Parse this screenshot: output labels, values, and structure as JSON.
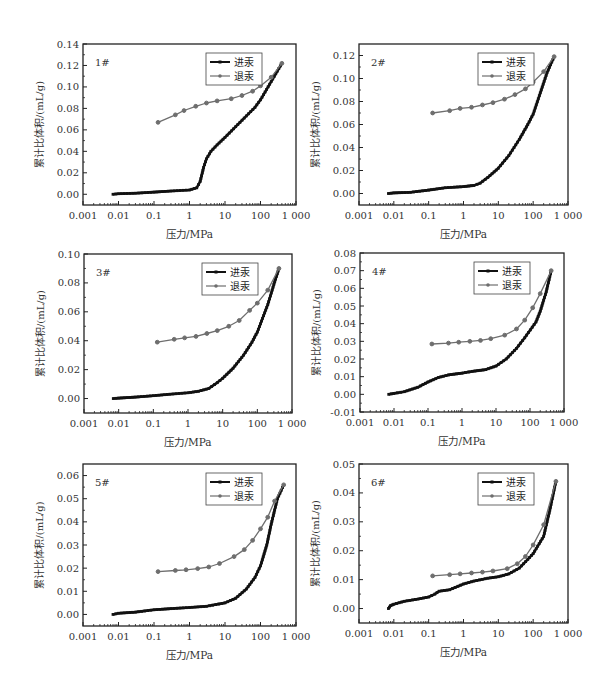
{
  "figure": {
    "layout": "3 rows x 2 columns of mercury intrusion/extrusion curves",
    "x_label": "压力/MPa",
    "y_label": "累计比体积/(mL/g)",
    "legend": [
      "进汞",
      "退汞"
    ],
    "colors": {
      "intrusion": "#111111",
      "extrusion": "#6e6e6e",
      "frame": "#222222"
    }
  },
  "chart_data": [
    {
      "type": "line",
      "panel_label": "1#",
      "title": "",
      "xlabel": "压力/MPa",
      "ylabel": "累计比体积/(mL/g)",
      "xscale": "log",
      "xlim": [
        0.001,
        1000
      ],
      "ylim": [
        -0.01,
        0.14
      ],
      "xticks": [
        "0.001",
        "0.01",
        "0.1",
        "1",
        "10",
        "100",
        "1 000"
      ],
      "yticks": [
        "0.00",
        "0.02",
        "0.04",
        "0.06",
        "0.08",
        "0.10",
        "0.12",
        "0.14"
      ],
      "ytick_values": [
        0,
        0.02,
        0.04,
        0.06,
        0.08,
        0.1,
        0.12,
        0.14
      ],
      "legend_position": "upper right",
      "grid": false,
      "series": [
        {
          "name": "进汞",
          "x": [
            0.007,
            0.01,
            0.03,
            0.1,
            0.3,
            1,
            1.6,
            2,
            2.5,
            3,
            4,
            6,
            10,
            20,
            40,
            70,
            100,
            200,
            400
          ],
          "values": [
            0.0,
            0.0005,
            0.001,
            0.002,
            0.003,
            0.004,
            0.006,
            0.012,
            0.025,
            0.033,
            0.04,
            0.046,
            0.053,
            0.063,
            0.073,
            0.081,
            0.088,
            0.105,
            0.122
          ]
        },
        {
          "name": "退汞",
          "x": [
            0.13,
            0.4,
            0.7,
            1.5,
            3,
            6,
            15,
            30,
            60,
            100,
            200,
            400
          ],
          "values": [
            0.067,
            0.074,
            0.078,
            0.082,
            0.085,
            0.087,
            0.089,
            0.092,
            0.096,
            0.101,
            0.109,
            0.122
          ]
        }
      ]
    },
    {
      "type": "line",
      "panel_label": "2#",
      "title": "",
      "xlabel": "压力/MPa",
      "ylabel": "累计比体积/(mL/g)",
      "xscale": "log",
      "xlim": [
        0.001,
        1000
      ],
      "ylim": [
        -0.01,
        0.13
      ],
      "xticks": [
        "0.001",
        "0.01",
        "0.1",
        "1",
        "10",
        "100",
        "1 000"
      ],
      "yticks": [
        "0.00",
        "0.02",
        "0.04",
        "0.06",
        "0.08",
        "0.10",
        "0.12"
      ],
      "ytick_values": [
        0,
        0.02,
        0.04,
        0.06,
        0.08,
        0.1,
        0.12
      ],
      "legend_position": "upper right",
      "grid": false,
      "series": [
        {
          "name": "进汞",
          "x": [
            0.007,
            0.01,
            0.03,
            0.1,
            0.3,
            1,
            2,
            3,
            5,
            10,
            20,
            40,
            70,
            100,
            150,
            250,
            400
          ],
          "values": [
            0.0,
            0.0005,
            0.001,
            0.003,
            0.005,
            0.006,
            0.007,
            0.009,
            0.014,
            0.022,
            0.033,
            0.047,
            0.06,
            0.069,
            0.085,
            0.105,
            0.119
          ]
        },
        {
          "name": "退汞",
          "x": [
            0.13,
            0.4,
            0.8,
            1.7,
            3.5,
            7,
            15,
            30,
            60,
            100,
            200,
            400
          ],
          "values": [
            0.07,
            0.072,
            0.074,
            0.075,
            0.077,
            0.079,
            0.082,
            0.086,
            0.091,
            0.097,
            0.106,
            0.119
          ]
        }
      ]
    },
    {
      "type": "line",
      "panel_label": "3#",
      "title": "",
      "xlabel": "压力/MPa",
      "ylabel": "累计比体积/(mL/g)",
      "xscale": "log",
      "xlim": [
        0.001,
        1000
      ],
      "ylim": [
        -0.01,
        0.1
      ],
      "xticks": [
        "0.001",
        "0.01",
        "0.1",
        "1",
        "10",
        "100",
        "1 000"
      ],
      "yticks": [
        "0.00",
        "0.02",
        "0.04",
        "0.06",
        "0.08",
        "0.10"
      ],
      "ytick_values": [
        0,
        0.02,
        0.04,
        0.06,
        0.08,
        0.1
      ],
      "legend_position": "upper right",
      "grid": false,
      "series": [
        {
          "name": "进汞",
          "x": [
            0.007,
            0.01,
            0.03,
            0.1,
            0.3,
            1,
            2,
            4,
            7,
            10,
            20,
            40,
            70,
            100,
            200,
            300,
            420
          ],
          "values": [
            0.0,
            0.0003,
            0.001,
            0.002,
            0.003,
            0.004,
            0.005,
            0.007,
            0.011,
            0.014,
            0.021,
            0.03,
            0.039,
            0.046,
            0.065,
            0.079,
            0.09
          ]
        },
        {
          "name": "退汞",
          "x": [
            0.13,
            0.4,
            0.8,
            1.7,
            3.5,
            7,
            15,
            30,
            60,
            100,
            200,
            420
          ],
          "values": [
            0.039,
            0.041,
            0.042,
            0.043,
            0.045,
            0.047,
            0.05,
            0.054,
            0.061,
            0.066,
            0.075,
            0.09
          ]
        }
      ]
    },
    {
      "type": "line",
      "panel_label": "4#",
      "title": "",
      "xlabel": "压力/MPa",
      "ylabel": "累计比体积/(mL/g)",
      "xscale": "log",
      "xlim": [
        0.001,
        1000
      ],
      "ylim": [
        -0.01,
        0.08
      ],
      "xticks": [
        "0.001",
        "0.01",
        "0.1",
        "1",
        "10",
        "100",
        "1 000"
      ],
      "yticks": [
        "-0.01",
        "0.00",
        "0.01",
        "0.02",
        "0.03",
        "0.04",
        "0.05",
        "0.06",
        "0.07",
        "0.08"
      ],
      "ytick_values": [
        -0.01,
        0,
        0.01,
        0.02,
        0.03,
        0.04,
        0.05,
        0.06,
        0.07,
        0.08
      ],
      "legend_position": "upper right",
      "grid": false,
      "series": [
        {
          "name": "进汞",
          "x": [
            0.007,
            0.01,
            0.02,
            0.05,
            0.1,
            0.2,
            0.4,
            1,
            2,
            5,
            10,
            20,
            40,
            70,
            150,
            200,
            300,
            420
          ],
          "values": [
            0.0,
            0.0005,
            0.0015,
            0.004,
            0.007,
            0.0095,
            0.011,
            0.012,
            0.013,
            0.014,
            0.016,
            0.02,
            0.026,
            0.032,
            0.041,
            0.047,
            0.058,
            0.07
          ]
        },
        {
          "name": "退汞",
          "x": [
            0.13,
            0.4,
            0.8,
            1.7,
            3.5,
            7,
            18,
            40,
            70,
            120,
            200,
            420
          ],
          "values": [
            0.0285,
            0.029,
            0.0295,
            0.03,
            0.0305,
            0.0315,
            0.0335,
            0.037,
            0.042,
            0.049,
            0.057,
            0.07
          ]
        }
      ]
    },
    {
      "type": "line",
      "panel_label": "5#",
      "title": "",
      "xlabel": "压力/MPa",
      "ylabel": "累计比体积/(mL/g)",
      "xscale": "log",
      "xlim": [
        0.001,
        1000
      ],
      "ylim": [
        -0.005,
        0.065
      ],
      "xticks": [
        "0.001",
        "0.01",
        "0.1",
        "1",
        "10",
        "100",
        "1 000"
      ],
      "yticks": [
        "0.00",
        "0.01",
        "0.02",
        "0.03",
        "0.04",
        "0.05",
        "0.06"
      ],
      "ytick_values": [
        0,
        0.01,
        0.02,
        0.03,
        0.04,
        0.05,
        0.06
      ],
      "legend_position": "upper right",
      "grid": false,
      "series": [
        {
          "name": "进汞",
          "x": [
            0.007,
            0.01,
            0.03,
            0.1,
            0.3,
            1,
            3,
            10,
            20,
            40,
            70,
            100,
            150,
            200,
            300,
            450
          ],
          "values": [
            0.0,
            0.0005,
            0.001,
            0.002,
            0.0025,
            0.003,
            0.0035,
            0.005,
            0.007,
            0.011,
            0.016,
            0.021,
            0.03,
            0.039,
            0.05,
            0.056
          ]
        },
        {
          "name": "退汞",
          "x": [
            0.13,
            0.4,
            0.8,
            1.7,
            3.5,
            7,
            18,
            35,
            60,
            100,
            160,
            250,
            450
          ],
          "values": [
            0.0185,
            0.019,
            0.0193,
            0.0198,
            0.0205,
            0.022,
            0.025,
            0.028,
            0.032,
            0.037,
            0.042,
            0.049,
            0.056
          ]
        }
      ]
    },
    {
      "type": "line",
      "panel_label": "6#",
      "title": "",
      "xlabel": "压力/MPa",
      "ylabel": "累计比体积/(mL/g)",
      "xscale": "log",
      "xlim": [
        0.001,
        1000
      ],
      "ylim": [
        -0.005,
        0.05
      ],
      "xticks": [
        "0.001",
        "0.01",
        "0.1",
        "1",
        "10",
        "100",
        "1 000"
      ],
      "yticks": [
        "0.00",
        "0.01",
        "0.02",
        "0.03",
        "0.04",
        "0.05"
      ],
      "ytick_values": [
        0,
        0.01,
        0.02,
        0.03,
        0.04,
        0.05
      ],
      "legend_position": "upper right",
      "grid": false,
      "series": [
        {
          "name": "进汞",
          "x": [
            0.007,
            0.008,
            0.01,
            0.02,
            0.05,
            0.1,
            0.15,
            0.2,
            0.4,
            1,
            2,
            5,
            10,
            20,
            40,
            70,
            100,
            200,
            300,
            450
          ],
          "values": [
            0.0,
            0.001,
            0.0015,
            0.0025,
            0.0033,
            0.004,
            0.005,
            0.006,
            0.0065,
            0.0085,
            0.0095,
            0.0105,
            0.011,
            0.012,
            0.014,
            0.017,
            0.019,
            0.025,
            0.034,
            0.044
          ]
        },
        {
          "name": "退汞",
          "x": [
            0.13,
            0.4,
            0.8,
            1.7,
            3.5,
            7,
            18,
            35,
            60,
            100,
            200,
            450
          ],
          "values": [
            0.0113,
            0.0117,
            0.012,
            0.0123,
            0.0126,
            0.013,
            0.0138,
            0.0155,
            0.018,
            0.022,
            0.029,
            0.044
          ]
        }
      ]
    }
  ],
  "panel_frames": [
    {
      "left": 83,
      "top": 44,
      "right": 296,
      "bottom": 205
    },
    {
      "left": 359,
      "top": 44,
      "right": 568,
      "bottom": 205
    },
    {
      "left": 84,
      "top": 254,
      "right": 292,
      "bottom": 413
    },
    {
      "left": 360,
      "top": 253,
      "right": 564,
      "bottom": 412
    },
    {
      "left": 83,
      "top": 464,
      "right": 296,
      "bottom": 626
    },
    {
      "left": 359,
      "top": 464,
      "right": 568,
      "bottom": 623
    }
  ]
}
